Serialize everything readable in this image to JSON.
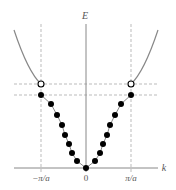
{
  "diagram": {
    "type": "dispersion-relation",
    "axes": {
      "y_label": "E",
      "x_label": "k"
    },
    "ticks": [
      {
        "label": "−π/a",
        "value": "-pi/a"
      },
      {
        "label": "0",
        "value": "0"
      },
      {
        "label": "π/a",
        "value": "pi/a"
      }
    ],
    "elements": {
      "parabola_outside_zone": "solid grey curve outside first Brillouin zone",
      "discrete_states": "filled black dots along V-shaped branch inside zone",
      "zone_boundary_open_circles": "open circles at ±π/a on upper dashed level",
      "zone_boundary_lines": "vertical dashed lines at k = ±π/a",
      "energy_levels": "two horizontal dashed lines marking band gap"
    },
    "colors": {
      "curve": "#888888",
      "axis": "#888888",
      "dashed": "#aaaaaa",
      "dots": "#000000",
      "labels": "#555555"
    }
  }
}
